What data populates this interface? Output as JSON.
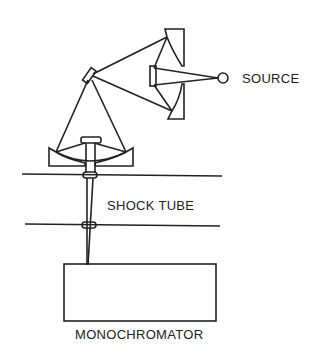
{
  "diagram": {
    "type": "optical-setup",
    "labels": {
      "source": "SOURCE",
      "shock_tube": "SHOCK TUBE",
      "monochromator": "MONOCHROMATOR"
    },
    "components": [
      {
        "name": "source",
        "shape": "circle"
      },
      {
        "name": "upper-concave-mirror-top",
        "shape": "concave-mirror"
      },
      {
        "name": "upper-concave-mirror-bottom",
        "shape": "concave-mirror"
      },
      {
        "name": "flat-mirror-center",
        "shape": "flat-mirror"
      },
      {
        "name": "diagonal-flat-mirror",
        "shape": "flat-mirror"
      },
      {
        "name": "lower-concave-mirror",
        "shape": "concave-mirror"
      },
      {
        "name": "shock-tube-windows",
        "shape": "window-pair"
      },
      {
        "name": "monochromator",
        "shape": "box"
      }
    ],
    "colors": {
      "line": "#222222",
      "background": "#ffffff"
    }
  }
}
